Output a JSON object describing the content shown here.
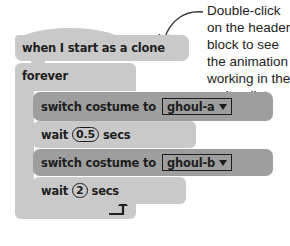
{
  "script": {
    "hat_block": {
      "label": "when I start as a clone"
    },
    "forever_block": {
      "label": "forever"
    },
    "inner_blocks": [
      {
        "type": "switch_costume",
        "label": "switch costume to",
        "value": "ghoul-a"
      },
      {
        "type": "wait",
        "label_before": "wait",
        "value": "0.5",
        "label_after": "secs"
      },
      {
        "type": "switch_costume",
        "label": "switch costume to",
        "value": "ghoul-b"
      },
      {
        "type": "wait",
        "label_before": "wait",
        "value": "2",
        "label_after": "secs"
      }
    ],
    "loop_icon": "loop-arrow-icon"
  },
  "annotation": {
    "lines": [
      "Double-click",
      "on the header",
      "block to see",
      "the animation",
      "working in the",
      "sprites list."
    ]
  },
  "colors": {
    "light_block": "#c9c9c9",
    "dark_block": "#9e9e9e",
    "text": "#1e1e1e"
  }
}
